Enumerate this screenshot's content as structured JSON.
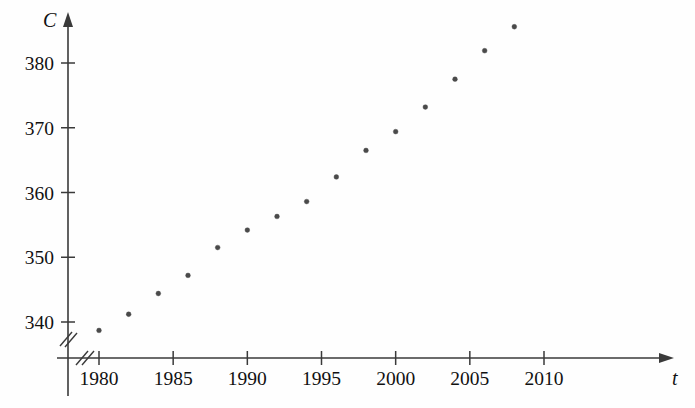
{
  "chart_data": {
    "type": "scatter",
    "title": "",
    "subtitle": "",
    "xlabel": "t",
    "ylabel": "C",
    "x": [
      1980,
      1982,
      1984,
      1986,
      1988,
      1990,
      1992,
      1994,
      1996,
      1998,
      2000,
      2002,
      2004,
      2006,
      2008
    ],
    "values": [
      338.7,
      341.2,
      344.4,
      347.2,
      351.5,
      354.2,
      356.3,
      358.6,
      362.4,
      366.5,
      369.4,
      373.2,
      377.5,
      381.9,
      385.6
    ],
    "points": [
      {
        "x": 1980,
        "y": 338.7
      },
      {
        "x": 1982,
        "y": 341.2
      },
      {
        "x": 1984,
        "y": 344.4
      },
      {
        "x": 1986,
        "y": 347.2
      },
      {
        "x": 1988,
        "y": 351.5
      },
      {
        "x": 1990,
        "y": 354.2
      },
      {
        "x": 1992,
        "y": 356.3
      },
      {
        "x": 1994,
        "y": 358.6
      },
      {
        "x": 1996,
        "y": 362.4
      },
      {
        "x": 1998,
        "y": 366.5
      },
      {
        "x": 2000,
        "y": 369.4
      },
      {
        "x": 2002,
        "y": 373.2
      },
      {
        "x": 2004,
        "y": 377.5
      },
      {
        "x": 2006,
        "y": 381.9
      },
      {
        "x": 2008,
        "y": 385.6
      }
    ],
    "xticks": [
      1980,
      1985,
      1990,
      1995,
      2000,
      2005,
      2010
    ],
    "xtick_labels": [
      "1980",
      "1985",
      "1990",
      "1995",
      "2000",
      "2005",
      "2010"
    ],
    "yticks": [
      340,
      350,
      360,
      370,
      380
    ],
    "ytick_labels": [
      "340",
      "350",
      "360",
      "370",
      "380"
    ],
    "xlim": [
      1978.7,
      2011.5
    ],
    "ylim": [
      335.5,
      387.5
    ],
    "grid": false,
    "legend": null,
    "axis_break_x": true,
    "axis_break_y": true,
    "marker_color": "#4a4a4a",
    "axis_color": "#3a3a3a"
  }
}
